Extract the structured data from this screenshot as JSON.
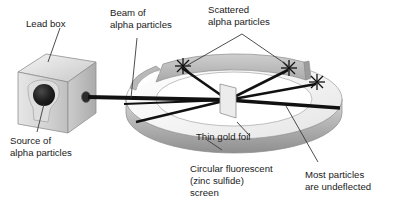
{
  "diagram": {
    "background_color": "#ffffff",
    "text_color": "#1a1a1a",
    "beam_color": "#111111",
    "leader_color": "#3a3a3a",
    "ring_fill_light": "#f2f2f2",
    "ring_fill_mid": "#c9c9c9",
    "ring_fill_dark": "#a0a0a0",
    "box_fill_light": "#ededed",
    "box_fill_mid": "#cfcfcf",
    "box_fill_dark": "#b4b4b4",
    "source_color": "#1b1b1b",
    "foil_color": "#e8e8e8"
  },
  "labels": {
    "lead_box": {
      "line1": "Lead box"
    },
    "beam_of_alpha": {
      "line1": "Beam of",
      "line2": "alpha particles"
    },
    "scattered_alpha": {
      "line1": "Scattered",
      "line2": "alpha particles"
    },
    "source_of_alpha": {
      "line1": "Source of",
      "line2": "alpha particles"
    },
    "thin_gold_foil": {
      "line1": "Thin gold foil"
    },
    "circular_screen": {
      "line1": "Circular fluorescent",
      "line2": "(zinc sulfide)",
      "line3": "screen"
    },
    "most_undeflected": {
      "line1": "Most particles",
      "line2": "are undeflected"
    }
  },
  "parts": {
    "lead_box": "lead-box-cube",
    "source": "alpha-source-disc",
    "aperture": "collimator-aperture",
    "ring": "circular-fluorescent-screen-ring",
    "foil": "thin-gold-foil-sheet",
    "flashes": [
      "scintillation-flash-left",
      "scintillation-flash-right",
      "scintillation-flash-far-right"
    ],
    "beams": [
      "undeflected-beam",
      "scattered-ray-upper-left",
      "scattered-ray-upper-right",
      "scattered-ray-far-right",
      "back-scattered-ray"
    ]
  }
}
